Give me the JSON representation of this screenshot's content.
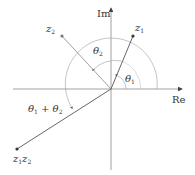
{
  "axes": {
    "real_label": "Re",
    "imag_label": "Im"
  },
  "points": {
    "z1": {
      "base": "z",
      "sub": "1"
    },
    "z2": {
      "base": "z",
      "sub": "2"
    },
    "product": {
      "a": "z",
      "asub": "1",
      "b": "z",
      "bsub": "2"
    }
  },
  "angles": {
    "theta1": {
      "base": "θ",
      "sub": "1"
    },
    "theta2": {
      "base": "θ",
      "sub": "2"
    },
    "sum": {
      "a": "θ",
      "asub": "1",
      "op": " + ",
      "b": "θ",
      "bsub": "2"
    }
  },
  "colors": {
    "axis": "#888888",
    "ray": "#555555",
    "arc": "#aaaaaa",
    "point": "#333333"
  }
}
